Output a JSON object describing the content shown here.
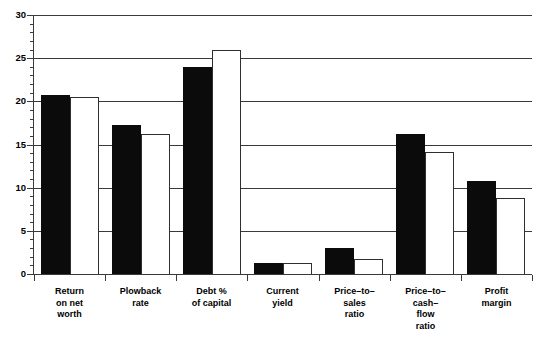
{
  "chart_data": {
    "type": "bar",
    "title": "",
    "subtitle": "",
    "xlabel": "",
    "ylabel": "",
    "ylim": [
      0,
      30
    ],
    "yticks": [
      0,
      5,
      10,
      15,
      20,
      25,
      30
    ],
    "ytick_labels": [
      "0",
      "5",
      "10",
      "15",
      "20",
      "25",
      "30"
    ],
    "minor_tick_step": 1,
    "grid": true,
    "grid_axis": "y",
    "legend": "none",
    "categories": [
      "Return\non net\nworth",
      "Plowback\nrate",
      "Debt %\nof capital",
      "Current\nyield",
      "Price–to–\nsales\nratio",
      "Price–to–\ncash–\nflow\nratio",
      "Profit\nmargin"
    ],
    "series": [
      {
        "name": "series-1",
        "color": "#0b0b0b",
        "fill": "solid-black",
        "values": [
          20.7,
          17.3,
          24.0,
          1.3,
          3.0,
          16.2,
          10.8
        ]
      },
      {
        "name": "series-2",
        "color": "#ffffff",
        "fill": "white-outlined",
        "values": [
          20.5,
          16.2,
          26.0,
          1.3,
          1.7,
          14.1,
          8.8
        ]
      }
    ]
  },
  "colors": {
    "series_1": "#0b0b0b",
    "series_2": "#ffffff",
    "axis": "#3a3a3a",
    "background": "#ffffff",
    "text": "#000000"
  }
}
